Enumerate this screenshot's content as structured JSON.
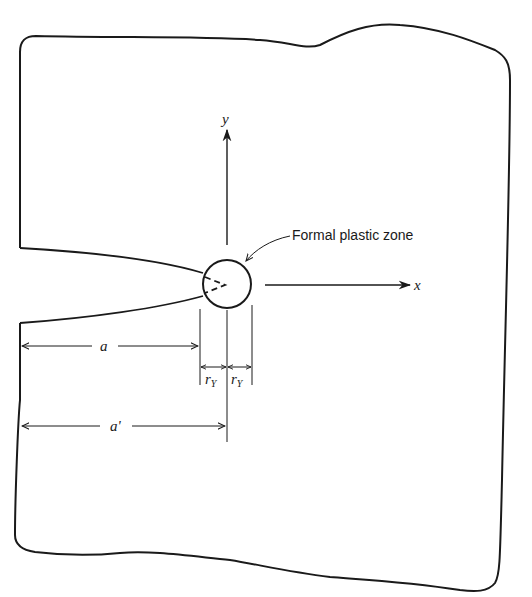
{
  "diagram": {
    "labels": {
      "y_axis": "y",
      "x_axis": "x",
      "plastic_zone": "Formal plastic zone",
      "crack_length": "a",
      "effective_crack_length": "a'",
      "plastic_radius_left": "r",
      "plastic_radius_left_sub": "Y",
      "plastic_radius_right": "r",
      "plastic_radius_right_sub": "Y"
    },
    "colors": {
      "ink": "#1a1a1a",
      "background": "#ffffff"
    }
  }
}
